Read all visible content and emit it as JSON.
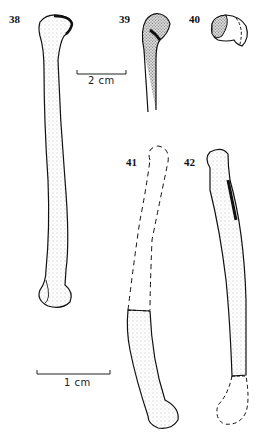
{
  "figure_labels": {
    "fig38": "38",
    "fig39": "39",
    "fig40": "40",
    "fig41": "41",
    "fig42": "42"
  },
  "scale_bars": {
    "upper": "2 cm",
    "lower": "1 cm"
  },
  "colors": {
    "ink": "#111111",
    "stipple": "#9a9a9a",
    "background": "#ffffff"
  }
}
